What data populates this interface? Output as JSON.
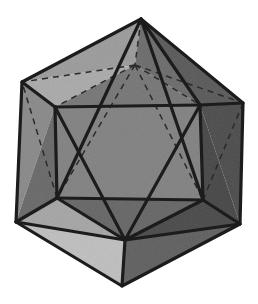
{
  "figure": {
    "name": "icosahedron-drawing",
    "canvas": {
      "width": 258,
      "height": 304,
      "background": "#ffffff"
    },
    "style": {
      "visible_edge_color": "#1c1c1c",
      "visible_edge_width": 3.2,
      "hidden_edge_color": "#2b2b2b",
      "hidden_edge_width": 1.5,
      "hidden_edge_dash": "6 5"
    },
    "palette": {
      "lightest": "#d8d8d8",
      "light": "#c6c6c6",
      "mid_light": "#b4b4b4",
      "mid": "#a2a2a2",
      "mid_dark": "#949494",
      "dark": "#868686",
      "darkest": "#777777"
    },
    "vertices": {
      "top": [
        141,
        19
      ],
      "ul_outer": [
        22,
        82
      ],
      "ur_outer": [
        243,
        103
      ],
      "ll_outer": [
        16,
        222
      ],
      "lr_outer": [
        240,
        224
      ],
      "bottom": [
        122,
        286
      ],
      "inner_ul": [
        55,
        107
      ],
      "inner_ur": [
        200,
        105
      ],
      "inner_ll": [
        57,
        198
      ],
      "inner_lr": [
        203,
        200
      ],
      "inner_top": [
        135,
        65
      ],
      "inner_bot": [
        125,
        240
      ]
    },
    "faces": [
      {
        "id": "f-top-left",
        "points": "141,19 22,82 135,65",
        "fill": "#c9c9c9"
      },
      {
        "id": "f-top-mid",
        "points": "141,19 135,65 200,105",
        "fill": "#a8a8a8"
      },
      {
        "id": "f-top-right",
        "points": "141,19 200,105 243,103",
        "fill": "#9a9a9a"
      },
      {
        "id": "f-upper-left-a",
        "points": "22,82 135,65 55,107",
        "fill": "#d2d2d2"
      },
      {
        "id": "f-upper-left-b",
        "points": "22,82 55,107 16,222",
        "fill": "#bdbdbd"
      },
      {
        "id": "f-upper-mid",
        "points": "135,65 200,105 55,107",
        "fill": "#b0b0b0"
      },
      {
        "id": "f-upper-right",
        "points": "200,105 243,103 240,224",
        "fill": "#8f8f8f"
      },
      {
        "id": "f-center",
        "points": "55,107 200,105 203,200 57,198",
        "fill": "#b8b8b8"
      },
      {
        "id": "f-center-left",
        "points": "55,107 57,198 16,222",
        "fill": "#a6a6a6"
      },
      {
        "id": "f-center-right",
        "points": "200,105 240,224 203,200",
        "fill": "#8a8a8a"
      },
      {
        "id": "f-lower-left",
        "points": "16,222 57,198 125,240",
        "fill": "#cfcfcf"
      },
      {
        "id": "f-lower-mid",
        "points": "57,198 203,200 125,240",
        "fill": "#a4a4a4"
      },
      {
        "id": "f-lower-right",
        "points": "203,200 240,224 125,240",
        "fill": "#8d8d8d"
      },
      {
        "id": "f-bottom-left",
        "points": "16,222 125,240 122,286",
        "fill": "#dedede"
      },
      {
        "id": "f-bottom-right",
        "points": "125,240 240,224 122,286",
        "fill": "#9f9f9f"
      }
    ],
    "visible_edges": [
      {
        "id": "e-outline",
        "points": "141,19 243,103 240,224 122,286 16,222 22,82 141,19"
      },
      {
        "id": "e-top-to-inner-ur",
        "points": "141,19 200,105"
      },
      {
        "id": "e-ul-to-inner-ul",
        "points": "22,82 55,107"
      },
      {
        "id": "e-ur-to-inner-ur",
        "points": "243,103 200,105"
      },
      {
        "id": "e-ll-to-inner-ll",
        "points": "16,222 57,198"
      },
      {
        "id": "e-lr-to-inner-lr",
        "points": "240,224 203,200"
      },
      {
        "id": "e-bot-to-inner-bot",
        "points": "122,286 125,240"
      },
      {
        "id": "e-hex-top",
        "points": "55,107 200,105"
      },
      {
        "id": "e-hex-left",
        "points": "55,107 57,198"
      },
      {
        "id": "e-hex-right",
        "points": "200,105 203,200"
      },
      {
        "id": "e-hex-bottom",
        "points": "57,198 203,200"
      },
      {
        "id": "e-diag-a",
        "points": "55,107 125,240"
      },
      {
        "id": "e-diag-b",
        "points": "200,105 125,240"
      },
      {
        "id": "e-diag-c",
        "points": "57,198 141,19"
      },
      {
        "id": "e-diag-d",
        "points": "203,200 141,19"
      },
      {
        "id": "e-inner-bot-ll",
        "points": "125,240 57,198"
      },
      {
        "id": "e-inner-bot-lr",
        "points": "125,240 203,200"
      },
      {
        "id": "e-ll-bot",
        "points": "16,222 125,240"
      },
      {
        "id": "e-lr-bot",
        "points": "240,224 125,240"
      }
    ],
    "hidden_edges": [
      {
        "id": "h-top-to-inner-top",
        "points": "141,19 135,65"
      },
      {
        "id": "h-inner-top-ul",
        "points": "135,65 22,82"
      },
      {
        "id": "h-inner-top-ur",
        "points": "135,65 243,103"
      },
      {
        "id": "h-inner-top-left",
        "points": "135,65 55,107"
      },
      {
        "id": "h-inner-top-right",
        "points": "135,65 200,105"
      },
      {
        "id": "h-inner-top-diag-l",
        "points": "135,65 57,198"
      },
      {
        "id": "h-inner-top-diag-r",
        "points": "135,65 203,200"
      },
      {
        "id": "h-band-left",
        "points": "22,82 16,222"
      },
      {
        "id": "h-band-right",
        "points": "243,103 240,224"
      },
      {
        "id": "h-inner-ll-ul",
        "points": "57,198 22,82"
      },
      {
        "id": "h-inner-lr-ur",
        "points": "203,200 243,103"
      },
      {
        "id": "h-inner-bot-ll-out",
        "points": "125,240 16,222"
      },
      {
        "id": "h-inner-bot-lr-out",
        "points": "125,240 240,224"
      },
      {
        "id": "h-bottom-apex-ll",
        "points": "122,286 16,222"
      },
      {
        "id": "h-bottom-apex-lr",
        "points": "122,286 240,224"
      }
    ]
  }
}
